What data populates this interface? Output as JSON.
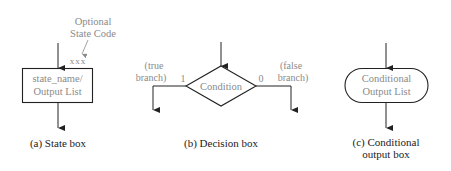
{
  "diagram": {
    "state_box": {
      "annotation_line1": "Optional",
      "annotation_line2": "State Code",
      "code": "xxx",
      "line1": "state_name/",
      "line2": "Output List",
      "caption": "(a) State box"
    },
    "decision_box": {
      "label": "Condition",
      "true_value": "1",
      "false_value": "0",
      "true_label_line1": "(true",
      "true_label_line2": "branch)",
      "false_label_line1": "(false",
      "false_label_line2": "branch)",
      "caption": "(b) Decision box"
    },
    "conditional_output_box": {
      "line1": "Conditional",
      "line2": "Output List",
      "caption_line1": "(c) Conditional",
      "caption_line2": "output box"
    },
    "colors": {
      "stroke": "#222222",
      "label_text": "#8a8a8a",
      "caption_text": "#222222"
    }
  }
}
